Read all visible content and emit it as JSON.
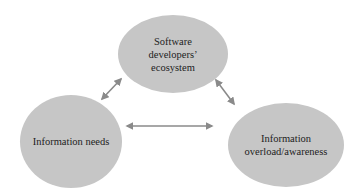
{
  "diagram": {
    "type": "triangle-relationship",
    "nodes": [
      {
        "id": "ecosystem",
        "label": "Software\ndevelopers’\necosystem",
        "position": "top"
      },
      {
        "id": "needs",
        "label": "Information needs",
        "position": "bottom-left"
      },
      {
        "id": "overload",
        "label": "Information\noverload/awareness",
        "position": "bottom-right"
      }
    ],
    "edges": [
      {
        "from": "ecosystem",
        "to": "needs",
        "style": "bidirectional-arrow"
      },
      {
        "from": "ecosystem",
        "to": "overload",
        "style": "bidirectional-arrow"
      },
      {
        "from": "needs",
        "to": "overload",
        "style": "bidirectional-arrow"
      }
    ],
    "colors": {
      "node_fill": "#c6c6c6",
      "text": "#222222",
      "arrow": "#8a8a8a",
      "background": "#ffffff"
    }
  }
}
